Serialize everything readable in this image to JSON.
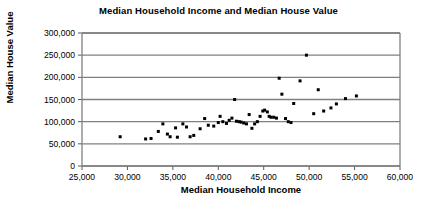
{
  "chart_data": {
    "type": "scatter",
    "title": "Median Household Income and Median House Value",
    "xlabel": "Median Household Income",
    "ylabel": "Median House Value",
    "xlim": [
      25000,
      60000
    ],
    "ylim": [
      0,
      300000
    ],
    "xticks": [
      25000,
      30000,
      35000,
      40000,
      45000,
      50000,
      55000,
      60000
    ],
    "xtick_labels": [
      "25,000",
      "30,000",
      "35,000",
      "40,000",
      "45,000",
      "50,000",
      "55,000",
      "60,000"
    ],
    "yticks": [
      0,
      50000,
      100000,
      150000,
      200000,
      250000,
      300000
    ],
    "ytick_labels": [
      "0",
      "50,000",
      "100,000",
      "150,000",
      "200,000",
      "250,000",
      "300,000"
    ],
    "grid": "horizontal",
    "legend": "none",
    "marker_color": "#000000",
    "gridline_color": "#808080",
    "plot_background": "#ffffff",
    "points": [
      [
        29200,
        66000
      ],
      [
        32000,
        61000
      ],
      [
        32600,
        62000
      ],
      [
        33400,
        78000
      ],
      [
        33900,
        95000
      ],
      [
        34400,
        72000
      ],
      [
        34700,
        66000
      ],
      [
        35300,
        86000
      ],
      [
        35500,
        65000
      ],
      [
        36100,
        95000
      ],
      [
        36500,
        88000
      ],
      [
        36900,
        66000
      ],
      [
        37300,
        69000
      ],
      [
        38000,
        84000
      ],
      [
        38500,
        107000
      ],
      [
        38900,
        92000
      ],
      [
        39500,
        90000
      ],
      [
        40000,
        98000
      ],
      [
        40200,
        112000
      ],
      [
        40500,
        100000
      ],
      [
        40900,
        96000
      ],
      [
        41200,
        103000
      ],
      [
        41500,
        108000
      ],
      [
        41800,
        150000
      ],
      [
        42000,
        101000
      ],
      [
        42300,
        100000
      ],
      [
        42500,
        99000
      ],
      [
        42800,
        97000
      ],
      [
        43100,
        95000
      ],
      [
        43400,
        116000
      ],
      [
        43700,
        85000
      ],
      [
        44000,
        95000
      ],
      [
        44300,
        100000
      ],
      [
        44600,
        112000
      ],
      [
        44900,
        124000
      ],
      [
        45100,
        126000
      ],
      [
        45400,
        122000
      ],
      [
        45600,
        112000
      ],
      [
        45800,
        110000
      ],
      [
        46100,
        110000
      ],
      [
        46400,
        108000
      ],
      [
        46700,
        198000
      ],
      [
        47000,
        162000
      ],
      [
        47400,
        107000
      ],
      [
        47700,
        100000
      ],
      [
        48000,
        98000
      ],
      [
        48300,
        141000
      ],
      [
        49000,
        192000
      ],
      [
        49700,
        250000
      ],
      [
        50500,
        118000
      ],
      [
        51000,
        172000
      ],
      [
        51600,
        124000
      ],
      [
        52400,
        131000
      ],
      [
        53000,
        140000
      ],
      [
        54000,
        152000
      ],
      [
        55200,
        158000
      ]
    ]
  }
}
